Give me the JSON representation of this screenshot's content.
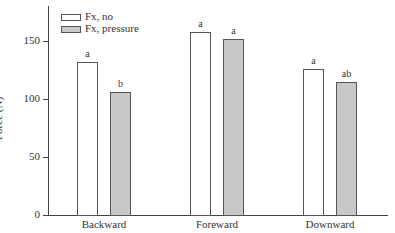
{
  "chart_data": {
    "type": "bar",
    "title": "",
    "xlabel": "",
    "ylabel": "Force (N)",
    "ylim": [
      0,
      180
    ],
    "yticks": [
      0,
      50,
      100,
      150
    ],
    "categories": [
      "Backward",
      "Foreward",
      "Downward"
    ],
    "series": [
      {
        "name": "Fx, no",
        "color": "#ffffff",
        "values": [
          132,
          158,
          126
        ],
        "labels": [
          "a",
          "a",
          "a"
        ]
      },
      {
        "name": "Fx, pressure",
        "color": "#c8c8c8",
        "values": [
          106,
          152,
          115
        ],
        "labels": [
          "b",
          "a",
          "ab"
        ]
      }
    ],
    "legend_position": "upper left",
    "grid": false
  }
}
